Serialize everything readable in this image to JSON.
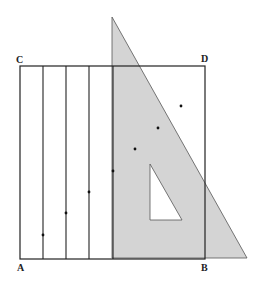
{
  "figure": {
    "type": "geometric-construction",
    "labels": {
      "top_left": "C",
      "top_right": "D",
      "bottom_left": "A",
      "bottom_right": "B"
    },
    "colors": {
      "line": "#222222",
      "set_square_fill": "#d4d4d4",
      "background": "#ffffff"
    },
    "vertical_lines_count": 4,
    "marked_points_count": 7
  }
}
